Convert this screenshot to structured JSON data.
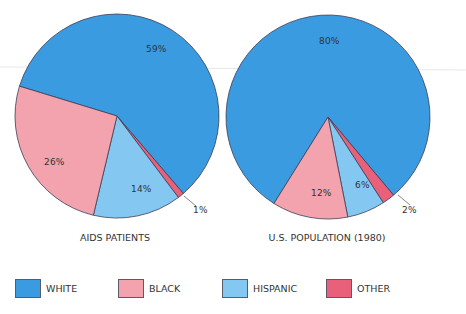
{
  "chart_data": [
    {
      "type": "pie",
      "title": "AIDS PATIENTS",
      "categories": [
        "WHITE",
        "BLACK",
        "HISPANIC",
        "OTHER"
      ],
      "values": [
        59,
        26,
        14,
        1
      ],
      "labels": [
        "59%",
        "26%",
        "14%",
        "1%"
      ],
      "colors": [
        "#3a9be0",
        "#f2a3ae",
        "#84c8f2",
        "#e8607a"
      ]
    },
    {
      "type": "pie",
      "title": "U.S. POPULATION (1980)",
      "categories": [
        "WHITE",
        "BLACK",
        "HISPANIC",
        "OTHER"
      ],
      "values": [
        80,
        12,
        6,
        2
      ],
      "labels": [
        "80%",
        "12%",
        "6%",
        "2%"
      ],
      "colors": [
        "#3a9be0",
        "#f2a3ae",
        "#84c8f2",
        "#e8607a"
      ]
    }
  ],
  "legend": {
    "position": "bottom",
    "items": [
      {
        "label": "WHITE",
        "color": "#3a9be0"
      },
      {
        "label": "BLACK",
        "color": "#f2a3ae"
      },
      {
        "label": "HISPANIC",
        "color": "#84c8f2"
      },
      {
        "label": "OTHER",
        "color": "#e8607a"
      }
    ]
  }
}
